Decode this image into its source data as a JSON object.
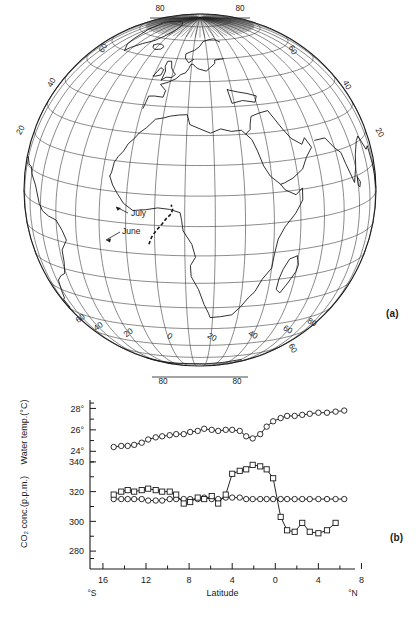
{
  "figure": {
    "panel_a_label": "(a)",
    "panel_b_label": "(b)"
  },
  "map": {
    "name": "globe-orthographic-atlantic-africa",
    "cruise_track_labels": [
      {
        "text": "July",
        "x": 131,
        "y": 216
      },
      {
        "text": "June",
        "x": 122,
        "y": 234
      }
    ],
    "top_longitude_labels": [
      "80",
      "80"
    ],
    "bottom_longitude_labels": [
      "80",
      "80"
    ],
    "left_latitude_labels": [
      "60",
      "40",
      "20",
      "0",
      "20",
      "40",
      "60"
    ],
    "right_latitude_labels": [
      "60",
      "40",
      "20",
      "0",
      "20",
      "40",
      "60"
    ],
    "bottom_meridian_labels": [
      "60",
      "40",
      "20",
      "0",
      "20",
      "40",
      "60",
      "80",
      "100",
      "60"
    ],
    "graticule_spacing_deg": 10
  },
  "chart_data": {
    "type": "line",
    "title": "",
    "xlabel": "Latitude",
    "x_axis_left_label": "°S",
    "x_axis_right_label": "°N",
    "xticks": [
      16,
      12,
      8,
      4,
      0,
      4,
      8
    ],
    "xtick_labels": [
      "16",
      "12",
      "8",
      "4",
      "0",
      "4",
      "8"
    ],
    "xlim": [
      -17.2,
      7.4
    ],
    "grid": false,
    "legend": "none",
    "axes": [
      {
        "id": "water_temp",
        "ylabel": "Water temp.(°C)",
        "yticks": [
          24,
          26,
          28
        ],
        "ytick_labels": [
          "24°",
          "26°",
          "28°"
        ],
        "ylim": [
          23.0,
          28.6
        ],
        "minor_tick_step": 1
      },
      {
        "id": "co2_conc",
        "ylabel": "CO₂ conc.(p.p.m.)",
        "yticks": [
          280,
          300,
          320,
          340
        ],
        "ytick_labels": [
          "280",
          "300",
          "320",
          "340"
        ],
        "ylim": [
          272,
          348
        ],
        "minor_tick_step": 10
      }
    ],
    "series": [
      {
        "name": "Water temperature",
        "axis": "water_temp",
        "marker": "circle",
        "unit": "°C",
        "points": [
          {
            "x": -15.0,
            "y": 24.4
          },
          {
            "x": -14.3,
            "y": 24.5
          },
          {
            "x": -13.7,
            "y": 24.5
          },
          {
            "x": -13.1,
            "y": 24.6
          },
          {
            "x": -12.4,
            "y": 24.8
          },
          {
            "x": -11.8,
            "y": 25.1
          },
          {
            "x": -11.1,
            "y": 25.3
          },
          {
            "x": -10.5,
            "y": 25.4
          },
          {
            "x": -9.8,
            "y": 25.5
          },
          {
            "x": -9.2,
            "y": 25.6
          },
          {
            "x": -8.5,
            "y": 25.6
          },
          {
            "x": -7.9,
            "y": 25.8
          },
          {
            "x": -7.2,
            "y": 25.9
          },
          {
            "x": -6.6,
            "y": 26.1
          },
          {
            "x": -5.9,
            "y": 26.0
          },
          {
            "x": -5.3,
            "y": 25.9
          },
          {
            "x": -4.6,
            "y": 26.0
          },
          {
            "x": -4.0,
            "y": 26.0
          },
          {
            "x": -3.3,
            "y": 25.9
          },
          {
            "x": -2.7,
            "y": 25.4
          },
          {
            "x": -2.1,
            "y": 25.2
          },
          {
            "x": -1.4,
            "y": 25.6
          },
          {
            "x": -0.8,
            "y": 26.3
          },
          {
            "x": -0.2,
            "y": 26.8
          },
          {
            "x": 0.5,
            "y": 27.1
          },
          {
            "x": 1.1,
            "y": 27.3
          },
          {
            "x": 1.8,
            "y": 27.3
          },
          {
            "x": 2.5,
            "y": 27.4
          },
          {
            "x": 3.2,
            "y": 27.5
          },
          {
            "x": 4.0,
            "y": 27.6
          },
          {
            "x": 4.8,
            "y": 27.6
          },
          {
            "x": 5.6,
            "y": 27.7
          },
          {
            "x": 6.4,
            "y": 27.8
          }
        ]
      },
      {
        "name": "Atmospheric CO2 concentration",
        "axis": "co2_conc",
        "marker": "circle",
        "unit": "p.p.m.",
        "points": [
          {
            "x": -15.0,
            "y": 315
          },
          {
            "x": -14.3,
            "y": 315
          },
          {
            "x": -13.7,
            "y": 315
          },
          {
            "x": -13.1,
            "y": 315
          },
          {
            "x": -12.4,
            "y": 315
          },
          {
            "x": -11.8,
            "y": 314
          },
          {
            "x": -11.1,
            "y": 314
          },
          {
            "x": -10.5,
            "y": 314
          },
          {
            "x": -9.8,
            "y": 315
          },
          {
            "x": -9.2,
            "y": 315
          },
          {
            "x": -8.5,
            "y": 315
          },
          {
            "x": -7.9,
            "y": 315
          },
          {
            "x": -7.2,
            "y": 315
          },
          {
            "x": -6.6,
            "y": 316
          },
          {
            "x": -5.9,
            "y": 315
          },
          {
            "x": -5.3,
            "y": 315
          },
          {
            "x": -4.6,
            "y": 316
          },
          {
            "x": -4.0,
            "y": 316
          },
          {
            "x": -3.3,
            "y": 316
          },
          {
            "x": -2.7,
            "y": 315
          },
          {
            "x": -2.1,
            "y": 315
          },
          {
            "x": -1.4,
            "y": 315
          },
          {
            "x": -0.8,
            "y": 315
          },
          {
            "x": -0.2,
            "y": 315
          },
          {
            "x": 0.5,
            "y": 315
          },
          {
            "x": 1.1,
            "y": 315
          },
          {
            "x": 1.8,
            "y": 315
          },
          {
            "x": 2.5,
            "y": 315
          },
          {
            "x": 3.2,
            "y": 315
          },
          {
            "x": 4.0,
            "y": 315
          },
          {
            "x": 4.8,
            "y": 315
          },
          {
            "x": 5.6,
            "y": 315
          },
          {
            "x": 6.4,
            "y": 315
          }
        ]
      },
      {
        "name": "Surface water CO2 partial pressure",
        "axis": "co2_conc",
        "marker": "square",
        "unit": "p.p.m.",
        "points": [
          {
            "x": -15.0,
            "y": 318
          },
          {
            "x": -14.3,
            "y": 320
          },
          {
            "x": -13.7,
            "y": 321
          },
          {
            "x": -13.1,
            "y": 320
          },
          {
            "x": -12.4,
            "y": 321
          },
          {
            "x": -11.8,
            "y": 322
          },
          {
            "x": -11.1,
            "y": 321
          },
          {
            "x": -10.5,
            "y": 320
          },
          {
            "x": -9.8,
            "y": 320
          },
          {
            "x": -9.2,
            "y": 318
          },
          {
            "x": -8.5,
            "y": 312
          },
          {
            "x": -7.9,
            "y": 313
          },
          {
            "x": -7.2,
            "y": 316
          },
          {
            "x": -6.6,
            "y": 315
          },
          {
            "x": -5.9,
            "y": 317
          },
          {
            "x": -5.3,
            "y": 312
          },
          {
            "x": -4.6,
            "y": 318
          },
          {
            "x": -4.0,
            "y": 332
          },
          {
            "x": -3.3,
            "y": 334
          },
          {
            "x": -2.7,
            "y": 335
          },
          {
            "x": -2.1,
            "y": 338
          },
          {
            "x": -1.4,
            "y": 337
          },
          {
            "x": -0.8,
            "y": 335
          },
          {
            "x": -0.2,
            "y": 329
          },
          {
            "x": 0.5,
            "y": 303
          },
          {
            "x": 1.1,
            "y": 294
          },
          {
            "x": 1.8,
            "y": 293
          },
          {
            "x": 2.5,
            "y": 299
          },
          {
            "x": 3.2,
            "y": 293
          },
          {
            "x": 4.0,
            "y": 292
          },
          {
            "x": 4.8,
            "y": 294
          },
          {
            "x": 5.6,
            "y": 299
          }
        ]
      }
    ]
  }
}
